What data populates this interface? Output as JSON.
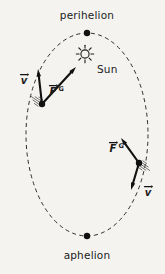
{
  "figure": {
    "kind": "orbit-diagram",
    "background_color": "#f4f3f0",
    "ink_color": "#111111",
    "canvas": {
      "width": 165,
      "height": 274
    }
  },
  "orbit": {
    "shape": "ellipse",
    "style": "dashed",
    "center": {
      "x": 87,
      "y": 134.5
    },
    "radius_x": 61,
    "radius_y": 101.5,
    "stroke_color": "#2b2b2b"
  },
  "labels": {
    "perihelion": "perihelion",
    "aphelion": "aphelion",
    "sun": "Sun"
  },
  "apsides": [
    {
      "name": "perihelion",
      "label": "perihelion",
      "dot_x": 87,
      "dot_y": 33,
      "label_x": 87,
      "label_y": 19
    },
    {
      "name": "aphelion",
      "label": "aphelion",
      "dot_x": 87,
      "dot_y": 236,
      "label_x": 87,
      "label_y": 259
    }
  ],
  "sun": {
    "label": "Sun",
    "x": 85,
    "y": 54,
    "core_radius": 4.1,
    "ray_count": 8,
    "label_x": 97,
    "label_y": 73
  },
  "planets": [
    {
      "id": "planet-left",
      "position": {
        "x": 42,
        "y": 104
      },
      "trail": {
        "angle_deg": 215,
        "line_count": 5,
        "length": 13
      },
      "velocity": {
        "symbol": "v",
        "accent": "vector-arrow",
        "tail": {
          "x": 42,
          "y": 104
        },
        "tip": {
          "x": 38,
          "y": 69
        },
        "label_x": 24,
        "label_y": 84
      },
      "gravity": {
        "symbol": "F",
        "subscript": "G",
        "accent": "vector-arrow",
        "tail": {
          "x": 42,
          "y": 104
        },
        "tip": {
          "x": 76,
          "y": 67
        },
        "label_x": 53,
        "label_y": 95
      }
    },
    {
      "id": "planet-right",
      "position": {
        "x": 139,
        "y": 163
      },
      "trail": {
        "angle_deg": 35,
        "line_count": 5,
        "length": 13
      },
      "velocity": {
        "symbol": "v",
        "accent": "vector-arrow",
        "tail": {
          "x": 139,
          "y": 163
        },
        "tip": {
          "x": 131,
          "y": 190
        },
        "label_x": 148,
        "label_y": 196
      },
      "gravity": {
        "symbol": "F",
        "subscript": "G",
        "accent": "vector-arrow",
        "tail": {
          "x": 139,
          "y": 163
        },
        "tip": {
          "x": 121,
          "y": 138
        },
        "label_x": 113,
        "label_y": 152
      }
    }
  ]
}
